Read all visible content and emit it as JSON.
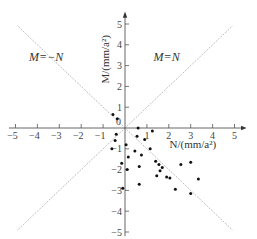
{
  "chart_data": {
    "type": "scatter",
    "title": "",
    "xlabel": "N/(mm/a²)",
    "ylabel": "M/(mm/a²)",
    "xlim": [
      -5,
      5
    ],
    "ylim": [
      -5,
      5
    ],
    "x_ticks": [
      "-5",
      "-4",
      "-3",
      "-2",
      "-1",
      "1",
      "2",
      "3",
      "4",
      "5"
    ],
    "y_ticks": [
      "5",
      "4",
      "3",
      "2",
      "1",
      "-1",
      "-2",
      "-3",
      "-4",
      "-5"
    ],
    "x_tick_values": [
      -5,
      -4,
      -3,
      -2,
      -1,
      1,
      2,
      3,
      4,
      5
    ],
    "y_tick_values": [
      5,
      4,
      3,
      2,
      1,
      -1,
      -2,
      -3,
      -4,
      -5
    ],
    "origin_label": "0",
    "grid": false,
    "legend": null,
    "reference_lines": [
      {
        "label": "M=N",
        "slope": 1,
        "x_range": [
          -4.9,
          4.9
        ]
      },
      {
        "label": "M=−N",
        "slope": -1,
        "x_range": [
          -4.9,
          4.9
        ]
      }
    ],
    "annotations": [
      {
        "text": "M=−N",
        "x": -3.6,
        "y": 3.2
      },
      {
        "text": "M=N",
        "x": 1.9,
        "y": 3.2
      }
    ],
    "points": [
      {
        "x": -0.55,
        "y": 0.65
      },
      {
        "x": -0.35,
        "y": 0.45
      },
      {
        "x": 0.6,
        "y": 0.0
      },
      {
        "x": 1.25,
        "y": -0.15
      },
      {
        "x": -0.4,
        "y": -0.3
      },
      {
        "x": -0.45,
        "y": -0.6
      },
      {
        "x": 0.05,
        "y": -0.8
      },
      {
        "x": 0.55,
        "y": -0.4
      },
      {
        "x": 0.9,
        "y": -0.55
      },
      {
        "x": -0.6,
        "y": -1.0
      },
      {
        "x": 0.15,
        "y": -1.4
      },
      {
        "x": 0.45,
        "y": -1.1
      },
      {
        "x": 0.75,
        "y": -1.3
      },
      {
        "x": 1.15,
        "y": -1.0
      },
      {
        "x": -0.15,
        "y": -1.7
      },
      {
        "x": 0.1,
        "y": -2.0
      },
      {
        "x": 0.65,
        "y": -1.85
      },
      {
        "x": 1.4,
        "y": -1.6
      },
      {
        "x": 1.55,
        "y": -1.75
      },
      {
        "x": 1.7,
        "y": -1.9
      },
      {
        "x": 1.6,
        "y": -2.05
      },
      {
        "x": 1.45,
        "y": -2.3
      },
      {
        "x": 1.9,
        "y": -2.35
      },
      {
        "x": 2.05,
        "y": -2.4
      },
      {
        "x": 2.55,
        "y": -1.75
      },
      {
        "x": 3.0,
        "y": -1.65
      },
      {
        "x": 3.35,
        "y": -2.45
      },
      {
        "x": 2.3,
        "y": -2.95
      },
      {
        "x": 3.0,
        "y": -3.15
      },
      {
        "x": -0.1,
        "y": -2.9
      },
      {
        "x": 0.65,
        "y": -2.7
      }
    ]
  }
}
